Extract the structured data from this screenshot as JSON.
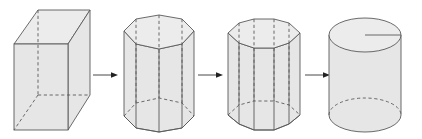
{
  "diagram": {
    "stages": [
      {
        "id": "rectangular-prism",
        "sides": 4
      },
      {
        "id": "octagonal-prism",
        "sides": 8
      },
      {
        "id": "decagonal-prism",
        "sides": 10
      },
      {
        "id": "cylinder",
        "sides": "infinite",
        "shows_radius": true
      }
    ],
    "arrows": [
      {
        "from": "rectangular-prism",
        "to": "octagonal-prism"
      },
      {
        "from": "octagonal-prism",
        "to": "decagonal-prism"
      },
      {
        "from": "decagonal-prism",
        "to": "cylinder"
      }
    ],
    "colors": {
      "fill": "#e6e6e6",
      "top_fill": "#ececec",
      "stroke": "#5a5a5a",
      "arrow": "#222222",
      "background": "#ffffff"
    }
  }
}
